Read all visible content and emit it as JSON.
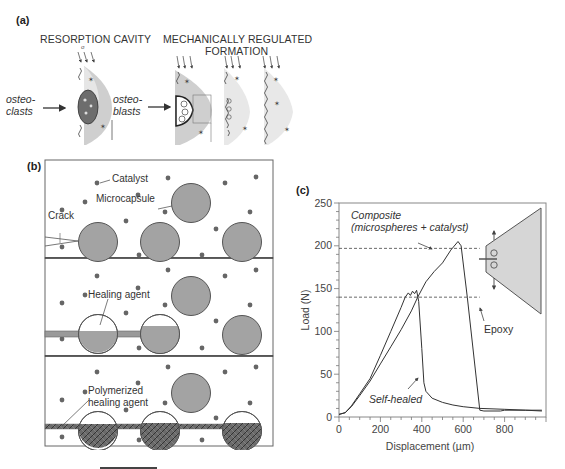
{
  "panel_a": {
    "label": "(a)",
    "title_left": "RESORPTION CAVITY",
    "title_right_line1": "MECHANICALLY REGULATED",
    "title_right_line2": "FORMATION",
    "arrow1_label_line1": "osteo-",
    "arrow1_label_line2": "clasts",
    "arrow2_label_line1": "osteo-",
    "arrow2_label_line2": "blasts",
    "small_mark": "σ"
  },
  "panel_b": {
    "label": "(b)",
    "labels": {
      "catalyst": "Catalyst",
      "microcapsule": "Microcapsule",
      "crack": "Crack",
      "healing_agent": "Healing agent",
      "polymerized_line1": "Polymerized",
      "polymerized_line2": "healing agent"
    }
  },
  "panel_c": {
    "label": "(c)",
    "annotation_composite_line1": "Composite",
    "annotation_composite_line2": "(microspheres + catalyst)",
    "annotation_epoxy": "Epoxy",
    "annotation_self_healed": "Self-healed"
  },
  "chart_data": {
    "type": "line",
    "title": "",
    "xlabel": "Displacement (µm)",
    "ylabel": "Load (N)",
    "xlim": [
      0,
      1000
    ],
    "ylim": [
      0,
      250
    ],
    "xticks": [
      0,
      200,
      400,
      600,
      800
    ],
    "yticks": [
      0,
      50,
      100,
      150,
      200,
      250
    ],
    "grid": false,
    "series": [
      {
        "name": "Composite (microspheres + catalyst)",
        "x": [
          0,
          30,
          60,
          100,
          150,
          200,
          250,
          300,
          350,
          380,
          420,
          460,
          500,
          540,
          575,
          590,
          620,
          680,
          700,
          780,
          800,
          900,
          980
        ],
        "y": [
          3,
          5,
          12,
          25,
          42,
          62,
          82,
          102,
          124,
          140,
          158,
          170,
          180,
          195,
          205,
          200,
          140,
          8,
          7,
          7,
          8,
          8,
          7
        ]
      },
      {
        "name": "Self-healed",
        "x": [
          0,
          30,
          60,
          100,
          150,
          200,
          250,
          300,
          320,
          335,
          345,
          355,
          365,
          375,
          385,
          400,
          410,
          420,
          450,
          500,
          550,
          600,
          680,
          800,
          900,
          980
        ],
        "y": [
          3,
          5,
          13,
          27,
          45,
          72,
          100,
          128,
          140,
          145,
          142,
          147,
          144,
          148,
          135,
          80,
          40,
          30,
          22,
          17,
          14,
          12,
          10,
          9,
          8,
          8
        ]
      }
    ],
    "reference_lines": [
      {
        "y": 197,
        "style": "dashed",
        "x_range": [
          0,
          680
        ]
      },
      {
        "y": 140,
        "style": "dashed",
        "x_range": [
          0,
          680
        ]
      }
    ],
    "annotations": [
      "Composite (microspheres + catalyst)",
      "Epoxy",
      "Self-healed"
    ]
  }
}
